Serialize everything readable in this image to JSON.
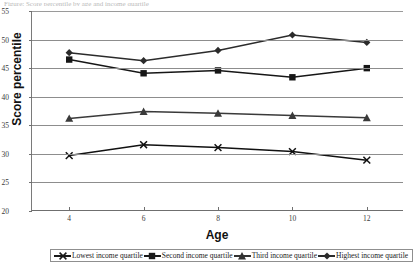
{
  "page": {
    "truncated_header": "Figure: Score percentile by age and income quartile"
  },
  "axes": {
    "y_title": "Score percentile",
    "x_title": "Age",
    "y_ticks": [
      "55",
      "50",
      "45",
      "40",
      "35",
      "30",
      "25",
      "20"
    ],
    "x_ticks": [
      "4",
      "6",
      "8",
      "10",
      "12"
    ]
  },
  "legend": {
    "items": [
      {
        "label": "Lowest income quartile",
        "marker": "cross-marker",
        "color": "#1a1a1a"
      },
      {
        "label": "Second income quartile",
        "marker": "square-marker",
        "color": "#1a1a1a"
      },
      {
        "label": "Third income quartile",
        "marker": "triangle-marker",
        "color": "#333333"
      },
      {
        "label": "Highest income quartile",
        "marker": "diamond-marker",
        "color": "#2b2b2b"
      }
    ]
  },
  "chart_data": {
    "type": "line",
    "title": "",
    "xlabel": "Age",
    "ylabel": "Score percentile",
    "x": [
      4,
      6,
      8,
      10,
      12
    ],
    "xlim": [
      3,
      13
    ],
    "ylim": [
      20,
      55
    ],
    "ytick_step": 5,
    "grid": true,
    "legend_position": "bottom",
    "series": [
      {
        "name": "Lowest income quartile",
        "marker": "x",
        "color": "#111111",
        "values": [
          29.7,
          31.6,
          31.1,
          30.4,
          28.9
        ]
      },
      {
        "name": "Second income quartile",
        "marker": "square",
        "color": "#161616",
        "values": [
          46.5,
          44.1,
          44.6,
          43.4,
          45.0
        ]
      },
      {
        "name": "Third income quartile",
        "marker": "triangle",
        "color": "#3a3a3a",
        "values": [
          36.2,
          37.4,
          37.1,
          36.7,
          36.3
        ]
      },
      {
        "name": "Highest income quartile",
        "marker": "diamond",
        "color": "#2b2b2b",
        "values": [
          47.7,
          46.3,
          48.1,
          50.8,
          49.5
        ]
      }
    ]
  }
}
